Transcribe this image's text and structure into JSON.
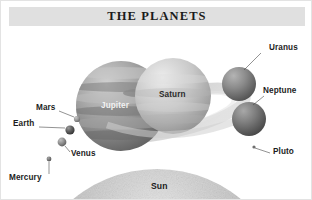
{
  "poster": {
    "title": "THE PLANETS",
    "background_color": "#ffffff",
    "banner_color": "#e0e0e0",
    "border_color": "#e3e3e3",
    "width": 312,
    "height": 200
  },
  "diagram": {
    "type": "solar-system-scale-illustration",
    "bodies": [
      {
        "name": "Sun",
        "label": "Sun",
        "label_position": "on-body",
        "label_x": 160,
        "label_y": 185,
        "cx": 156,
        "cy": 300,
        "r": 132,
        "color": "#b6b6b6",
        "has_leader_line": false
      },
      {
        "name": "Jupiter",
        "label": "Jupiter",
        "label_position": "on-body",
        "label_x": 100,
        "label_y": 105,
        "cx": 120,
        "cy": 105,
        "r": 45,
        "color": "#9a9a9a",
        "has_leader_line": false
      },
      {
        "name": "Saturn",
        "label": "Saturn",
        "label_position": "on-body",
        "label_x": 158,
        "label_y": 94,
        "cx": 172,
        "cy": 95,
        "r": 38,
        "color": "#c3c3c3",
        "has_rings": true,
        "has_leader_line": false
      },
      {
        "name": "Uranus",
        "label": "Uranus",
        "label_position": "right",
        "label_x": 268,
        "label_y": 48,
        "cx": 238,
        "cy": 83,
        "r": 17,
        "color": "#8c8c8c",
        "has_leader_line": true,
        "leader": [
          260,
          52,
          243,
          69
        ]
      },
      {
        "name": "Neptune",
        "label": "Neptune",
        "label_position": "right",
        "label_x": 262,
        "label_y": 91,
        "cx": 248,
        "cy": 118,
        "r": 17,
        "color": "#7e7e7e",
        "has_leader_line": true,
        "leader": [
          263,
          95,
          252,
          104
        ]
      },
      {
        "name": "Pluto",
        "label": "Pluto",
        "label_position": "right",
        "label_x": 272,
        "label_y": 152,
        "cx": 253,
        "cy": 146,
        "r": 1.6,
        "color": "#6f6f6f",
        "has_leader_line": true,
        "leader": [
          269,
          152,
          254,
          147
        ]
      },
      {
        "name": "Mars",
        "label": "Mars",
        "label_position": "left",
        "label_x": 35,
        "label_y": 108,
        "cx": 76,
        "cy": 118,
        "r": 3.1,
        "color": "#9b9b9b",
        "has_leader_line": true,
        "leader": [
          58,
          110,
          73,
          116
        ]
      },
      {
        "name": "Earth",
        "label": "Earth",
        "label_position": "left",
        "label_x": 12,
        "label_y": 124,
        "cx": 69,
        "cy": 129,
        "r": 4.6,
        "color": "#5f5f5f",
        "has_leader_line": true,
        "leader": [
          38,
          126,
          64,
          127
        ]
      },
      {
        "name": "Venus",
        "label": "Venus",
        "label_position": "right",
        "label_x": 70,
        "label_y": 154,
        "cx": 61,
        "cy": 141,
        "r": 4.4,
        "color": "#8f8f8f",
        "has_leader_line": true,
        "leader": [
          69,
          151,
          64,
          145
        ]
      },
      {
        "name": "Mercury",
        "label": "Mercury",
        "label_position": "below",
        "label_x": 8,
        "label_y": 178,
        "cx": 48,
        "cy": 158,
        "r": 2.4,
        "color": "#7a7a7a",
        "has_leader_line": true,
        "leader": [
          48,
          173,
          48,
          161
        ]
      }
    ]
  }
}
